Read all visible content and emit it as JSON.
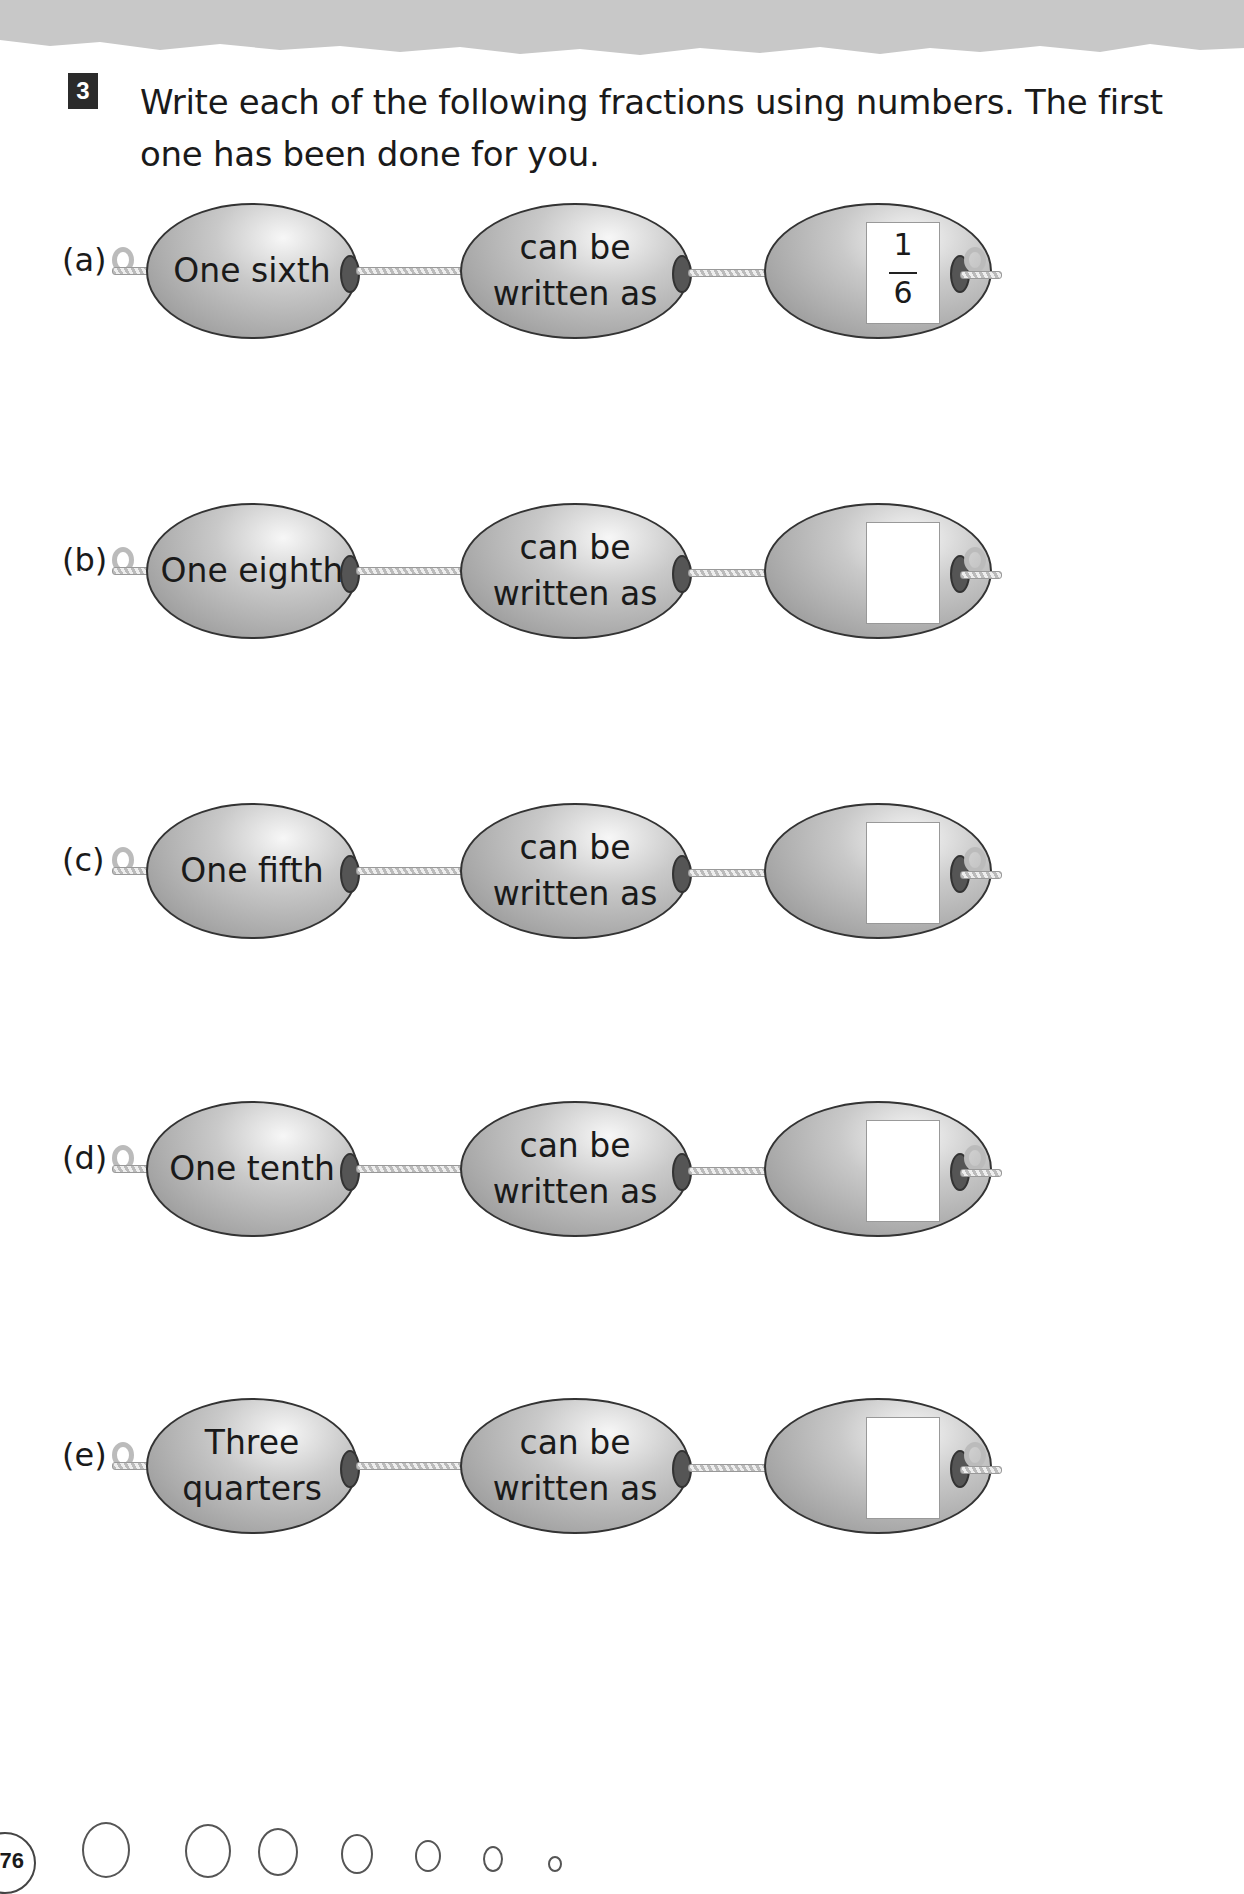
{
  "question": {
    "number": "3",
    "instruction": "Write each of the following fractions using numbers. The first one has been done for you."
  },
  "rows": [
    {
      "label": "(a)",
      "words": "One sixth",
      "middle_line1": "can be",
      "middle_line2": "written as",
      "numerator": "1",
      "denominator": "6",
      "answered": true
    },
    {
      "label": "(b)",
      "words": "One eighth",
      "middle_line1": "can be",
      "middle_line2": "written as",
      "numerator": "",
      "denominator": "",
      "answered": false
    },
    {
      "label": "(c)",
      "words": "One fifth",
      "middle_line1": "can be",
      "middle_line2": "written as",
      "numerator": "",
      "denominator": "",
      "answered": false
    },
    {
      "label": "(d)",
      "words": "One tenth",
      "middle_line1": "can be",
      "middle_line2": "written as",
      "numerator": "",
      "denominator": "",
      "answered": false
    },
    {
      "label": "(e)",
      "words": "Three quarters",
      "middle_line1": "can be",
      "middle_line2": "written as",
      "numerator": "",
      "denominator": "",
      "answered": false
    }
  ],
  "footer": {
    "page_number": "76"
  }
}
